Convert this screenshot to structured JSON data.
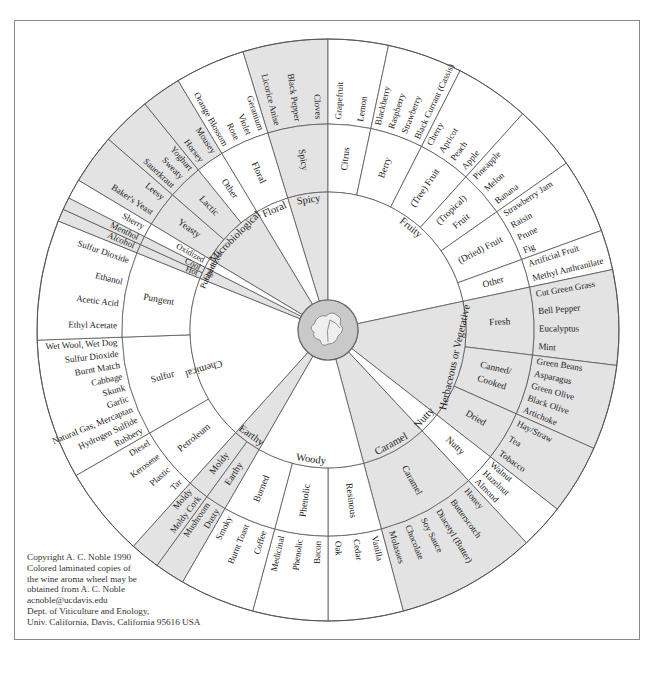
{
  "title": "Wine Aroma Wheel",
  "colors": {
    "shade": "#e3e3e3",
    "line": "#555555",
    "center": "#c9c9c9",
    "frame": "#8a8a8a"
  },
  "geometry": {
    "cx": 328,
    "cy": 330,
    "r_center": 30,
    "r1": 138,
    "r2": 206,
    "r3": 291
  },
  "tier1": [
    {
      "label": "Spicy",
      "a0": -17,
      "a1": 0,
      "shade": true
    },
    {
      "label": "Fruity",
      "a0": 0,
      "a1": 78,
      "shade": false
    },
    {
      "label": "Herbaceous or Vegetative",
      "a0": 78,
      "a1": 128,
      "shade": true
    },
    {
      "label": "Nutty",
      "a0": 128,
      "a1": 137,
      "shade": false
    },
    {
      "label": "Caramel",
      "a0": 137,
      "a1": 165,
      "shade": true
    },
    {
      "label": "Woody",
      "a0": 165,
      "a1": 210,
      "shade": false
    },
    {
      "label": "Earthy",
      "a0": 210,
      "a1": 222,
      "shade": true
    },
    {
      "label": "Chemical",
      "a0": 222,
      "a1": 292,
      "shade": false
    },
    {
      "label": "Pungent",
      "a0": 292,
      "a1": 297,
      "shade": true
    },
    {
      "label": "Oxidized",
      "a0": 297,
      "a1": 301,
      "shade": false
    },
    {
      "label": "Microbiological",
      "a0": 301,
      "a1": 329,
      "shade": true
    },
    {
      "label": "Floral",
      "a0": 329,
      "a1": 343,
      "shade": false
    }
  ],
  "tier2": [
    {
      "label": "Spicy",
      "a0": -17,
      "a1": 0,
      "shade": true
    },
    {
      "label": "Citrus",
      "a0": 0,
      "a1": 12,
      "shade": false
    },
    {
      "label": "Berry",
      "a0": 12,
      "a1": 27,
      "shade": false
    },
    {
      "label": "(Tree) Fruit",
      "a0": 27,
      "a1": 42,
      "shade": false
    },
    {
      "label": "(Tropical) Fruit",
      "a0": 42,
      "a1": 55,
      "shade": false
    },
    {
      "label": "(Dried) Fruit",
      "a0": 55,
      "a1": 70,
      "shade": false
    },
    {
      "label": "Other",
      "a0": 70,
      "a1": 78,
      "shade": false
    },
    {
      "label": "Fresh",
      "a0": 78,
      "a1": 97,
      "shade": true
    },
    {
      "label": "Canned/ Cooked",
      "a0": 97,
      "a1": 114,
      "shade": true
    },
    {
      "label": "Dried",
      "a0": 114,
      "a1": 128,
      "shade": true
    },
    {
      "label": "Nutty",
      "a0": 128,
      "a1": 137,
      "shade": false
    },
    {
      "label": "Caramel",
      "a0": 137,
      "a1": 165,
      "shade": true
    },
    {
      "label": "Resinous",
      "a0": 165,
      "a1": 180,
      "shade": false
    },
    {
      "label": "Phenolic",
      "a0": 180,
      "a1": 195,
      "shade": false
    },
    {
      "label": "Burned",
      "a0": 195,
      "a1": 210,
      "shade": false
    },
    {
      "label": "Earthy",
      "a0": 210,
      "a1": 216,
      "shade": true
    },
    {
      "label": "Moldy",
      "a0": 216,
      "a1": 222,
      "shade": true
    },
    {
      "label": "Petroleum",
      "a0": 222,
      "a1": 240,
      "shade": false
    },
    {
      "label": "Sulfur",
      "a0": 240,
      "a1": 268,
      "shade": false
    },
    {
      "label": "Pungent",
      "a0": 268,
      "a1": 292,
      "shade": false
    },
    {
      "label": "Hot",
      "a0": 292,
      "a1": 294.5,
      "shade": true
    },
    {
      "label": "Cool",
      "a0": 294.5,
      "a1": 297,
      "shade": true
    },
    {
      "label": "Oxidized",
      "a0": 297,
      "a1": 301,
      "shade": false
    },
    {
      "label": "Yeasty",
      "a0": 301,
      "a1": 311,
      "shade": true
    },
    {
      "label": "Lactic",
      "a0": 311,
      "a1": 321,
      "shade": true
    },
    {
      "label": "Other",
      "a0": 321,
      "a1": 329,
      "shade": false
    },
    {
      "label": "Floral",
      "a0": 329,
      "a1": 343,
      "shade": false
    }
  ],
  "tier3": [
    {
      "a0": -17,
      "a1": 0,
      "shade": true,
      "items": [
        "Licorice Anise",
        "Black Pepper",
        "Cloves"
      ]
    },
    {
      "a0": 0,
      "a1": 12,
      "shade": false,
      "items": [
        "Grapefruit",
        "Lemon"
      ]
    },
    {
      "a0": 12,
      "a1": 27,
      "shade": false,
      "items": [
        "Blackberry",
        "Raspberry",
        "Strawberry",
        "Black Currant (Cassis)"
      ]
    },
    {
      "a0": 27,
      "a1": 42,
      "shade": false,
      "items": [
        "Cherry",
        "Apricot",
        "Peach",
        "Apple"
      ]
    },
    {
      "a0": 42,
      "a1": 55,
      "shade": false,
      "items": [
        "Pineapple",
        "Melon",
        "Banana"
      ]
    },
    {
      "a0": 55,
      "a1": 70,
      "shade": false,
      "items": [
        "Strawberry Jam",
        "Raisin",
        "Prune",
        "Fig"
      ]
    },
    {
      "a0": 70,
      "a1": 78,
      "shade": false,
      "items": [
        "Artificial Fruit",
        "Methyl Anthranilate"
      ]
    },
    {
      "a0": 78,
      "a1": 97,
      "shade": true,
      "items": [
        "Cut Green Grass",
        "Bell Pepper",
        "Eucalyptus",
        "Mint"
      ]
    },
    {
      "a0": 97,
      "a1": 114,
      "shade": true,
      "items": [
        "Green Beans",
        "Asparagus",
        "Green Olive",
        "Black Olive",
        "Artichoke"
      ]
    },
    {
      "a0": 114,
      "a1": 128,
      "shade": true,
      "items": [
        "Hay/Straw",
        "Tea",
        "Tobacco"
      ]
    },
    {
      "a0": 128,
      "a1": 137,
      "shade": false,
      "items": [
        "Walnut",
        "Hazelnut",
        "Almond"
      ]
    },
    {
      "a0": 137,
      "a1": 165,
      "shade": true,
      "items": [
        "Honey",
        "Butterscotch",
        "Diacetyl (Butter)",
        "Soy Sauce",
        "Chocolate",
        "Molasses"
      ]
    },
    {
      "a0": 165,
      "a1": 180,
      "shade": false,
      "items": [
        "Vanilla",
        "Cedar",
        "Oak"
      ]
    },
    {
      "a0": 180,
      "a1": 195,
      "shade": false,
      "items": [
        "Bacon",
        "Phenolic",
        "Medicinal"
      ]
    },
    {
      "a0": 195,
      "a1": 210,
      "shade": false,
      "items": [
        "Coffee",
        "Burnt Toast",
        "Smoky"
      ]
    },
    {
      "a0": 210,
      "a1": 216,
      "shade": true,
      "items": [
        "Dusty",
        "Mushroom"
      ]
    },
    {
      "a0": 216,
      "a1": 222,
      "shade": true,
      "items": [
        "Moldy Cork",
        "Moldy"
      ]
    },
    {
      "a0": 222,
      "a1": 240,
      "shade": false,
      "items": [
        "Tar",
        "Plastic",
        "Kerosene",
        "Diesel"
      ]
    },
    {
      "a0": 240,
      "a1": 268,
      "shade": false,
      "items": [
        "Rubbery",
        "Hydrogen Sulfide",
        "Natural Gas, Mercaptan",
        "Garlic",
        "Skunk",
        "Cabbage",
        "Burnt Match",
        "Sulfur Dioxide",
        "Wet Wool, Wet Dog"
      ]
    },
    {
      "a0": 268,
      "a1": 292,
      "shade": false,
      "items": [
        "Ethyl Acetate",
        "Acetic Acid",
        "Ethanol",
        "Sulfur Dioxide"
      ]
    },
    {
      "a0": 292,
      "a1": 294.5,
      "shade": true,
      "items": [
        "Alcohol"
      ]
    },
    {
      "a0": 294.5,
      "a1": 297,
      "shade": true,
      "items": [
        "Menthol"
      ]
    },
    {
      "a0": 297,
      "a1": 301,
      "shade": false,
      "items": [
        "Sherry"
      ]
    },
    {
      "a0": 301,
      "a1": 311,
      "shade": true,
      "items": [
        "Baker's Yeast",
        "Leesy"
      ]
    },
    {
      "a0": 311,
      "a1": 321,
      "shade": true,
      "items": [
        "Sauerkraut",
        "Sweaty",
        "Yoghurt"
      ]
    },
    {
      "a0": 321,
      "a1": 329,
      "shade": true,
      "items": [
        "Horsey",
        "Mousey"
      ]
    },
    {
      "a0": 329,
      "a1": 343,
      "shade": false,
      "items": [
        "Orange Blossom",
        "Rose",
        "Violet",
        "Geranium"
      ]
    }
  ],
  "center_icon": "grape-leaf-icon",
  "copyright": [
    "Copyright A. C. Noble 1990",
    "Colored laminated copies of",
    "the wine aroma wheel may be",
    "obtained from A. C. Noble",
    "acnoble@ucdavis.edu",
    "Dept. of Viticulture and Enology,",
    "Univ. California, Davis, California 95616 USA"
  ]
}
